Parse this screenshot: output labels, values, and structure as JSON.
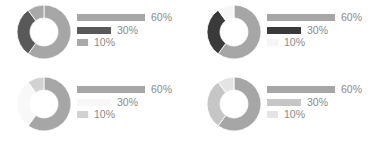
{
  "chart_data": [
    {
      "type": "pie",
      "variant": "donut",
      "categories": [
        "60%",
        "30%",
        "10%"
      ],
      "values": [
        60,
        30,
        10
      ],
      "colors": [
        "#a6a6a6",
        "#595959",
        "#a9a9a9"
      ],
      "legend": [
        "60%",
        "30%",
        "10%"
      ],
      "legend_position": "right"
    },
    {
      "type": "pie",
      "variant": "donut",
      "categories": [
        "60%",
        "30%",
        "10%"
      ],
      "values": [
        60,
        30,
        10
      ],
      "colors": [
        "#a6a6a6",
        "#3a3a3a",
        "#f6f6f6"
      ],
      "legend": [
        "60%",
        "30%",
        "10%"
      ],
      "legend_position": "right"
    },
    {
      "type": "pie",
      "variant": "donut",
      "categories": [
        "60%",
        "30%",
        "10%"
      ],
      "values": [
        60,
        30,
        10
      ],
      "colors": [
        "#a6a6a6",
        "#f8f8f8",
        "#d2d2d2"
      ],
      "legend": [
        "60%",
        "30%",
        "10%"
      ],
      "legend_position": "right"
    },
    {
      "type": "pie",
      "variant": "donut",
      "categories": [
        "60%",
        "30%",
        "10%"
      ],
      "values": [
        60,
        30,
        10
      ],
      "colors": [
        "#a6a6a6",
        "#c6c6c6",
        "#e4e4e4"
      ],
      "legend": [
        "60%",
        "30%",
        "10%"
      ],
      "legend_position": "right"
    }
  ],
  "charts": [
    {
      "labels": [
        "60%",
        "30%",
        "10%"
      ]
    },
    {
      "labels": [
        "60%",
        "30%",
        "10%"
      ]
    },
    {
      "labels": [
        "60%",
        "30%",
        "10%"
      ]
    },
    {
      "labels": [
        "60%",
        "30%",
        "10%"
      ]
    }
  ]
}
